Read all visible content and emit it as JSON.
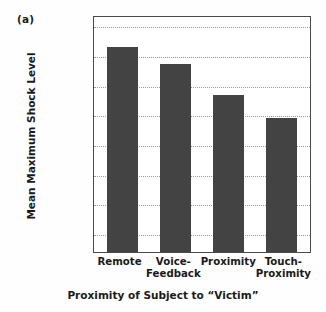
{
  "figure": {
    "panel_label": "(a)",
    "y_axis_title": "Mean Maximum Shock Level",
    "x_axis_title": "Proximity of Subject to “Victim”"
  },
  "chart_data": {
    "type": "bar",
    "title": "",
    "xlabel": "Proximity of Subject to “Victim”",
    "ylabel": "Mean Maximum Shock Level",
    "categories": [
      "Remote",
      "Voice-Feedback",
      "Proximity",
      "Touch-Proximity"
    ],
    "category_lines": [
      [
        "Remote"
      ],
      [
        "Voice-",
        "Feedback"
      ],
      [
        "Proximity"
      ],
      [
        "Touch-",
        "Proximity"
      ]
    ],
    "values": [
      7.28,
      6.71,
      5.65,
      4.89
    ],
    "value_labels": [
      "“Danger: Severe Shock”",
      "between “Extreme Intensity” and “Danger: Severe Shock”",
      "between “Intense” and “Extreme Intensity”",
      "just below “Intense”"
    ],
    "ytick_labels": [
      "“Slight”",
      "“Moderate”",
      "“Strong”",
      "“Very Strong”",
      "“Intense”",
      "“Extreme Intensity”",
      "“Danger: Severe Shock”",
      "“XXX”"
    ],
    "ytick_label_lines": [
      [
        "“Slight”"
      ],
      [
        "“Moderate”"
      ],
      [
        "“Strong”"
      ],
      [
        "“Very",
        "Strong”"
      ],
      [
        "“Intense”"
      ],
      [
        "“Extreme",
        "Intensity”"
      ],
      [
        "“Danger:",
        "Severe",
        "Shock”"
      ],
      [
        "“XXX”"
      ]
    ],
    "ytick_values": [
      1,
      2,
      3,
      4,
      5,
      6,
      7,
      8
    ],
    "ylim": [
      0.35,
      8.35
    ],
    "grid": true,
    "grid_style": "dotted-horizontal",
    "legend": "none",
    "bar_color": "#434343",
    "frame_color": "#4a4a4a",
    "grid_color": "#9a9a9a",
    "background": "#ffffff"
  }
}
